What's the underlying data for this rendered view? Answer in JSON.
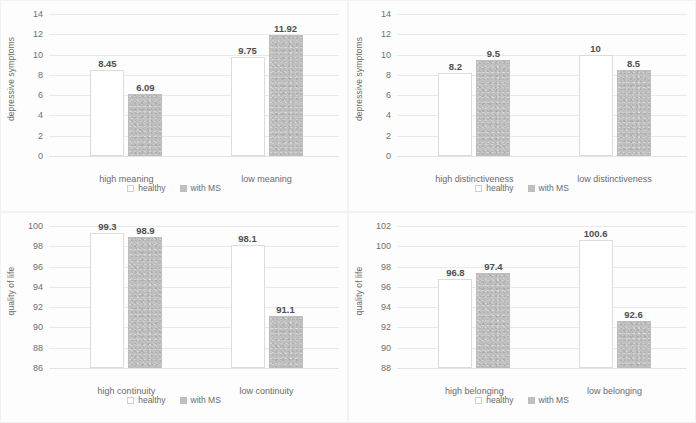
{
  "figure": {
    "panel_count": 4,
    "legend": {
      "healthy_label": "healthy",
      "ms_label": "with MS"
    },
    "colors": {
      "healthy_fill": "#ffffff",
      "healthy_border": "#dcdcdc",
      "ms_fill": "#c0c0c0",
      "ms_border": "#bdbdbd",
      "gridline": "#e9e9e9",
      "text": "#6b6b6b",
      "background": "#fdfdfd"
    }
  },
  "chart_data": [
    {
      "type": "bar",
      "panel": "top-left",
      "title": "",
      "xlabel": "",
      "ylabel": "depressive symptoms",
      "categories": [
        "high meaning",
        "low meaning"
      ],
      "series": [
        {
          "name": "healthy",
          "values": [
            8.45,
            9.75
          ]
        },
        {
          "name": "with MS",
          "values": [
            6.09,
            11.92
          ]
        }
      ],
      "data_labels": [
        "8.45",
        "6.09",
        "9.75",
        "11.92"
      ],
      "ylim": [
        0,
        14
      ],
      "yticks": [
        0,
        2,
        4,
        6,
        8,
        10,
        12,
        14
      ],
      "ytick_labels": [
        "0",
        "2",
        "4",
        "6",
        "8",
        "10",
        "12",
        "14"
      ],
      "grid": true,
      "legend_position": "bottom"
    },
    {
      "type": "bar",
      "panel": "top-right",
      "title": "",
      "xlabel": "",
      "ylabel": "depressive symptoms",
      "categories": [
        "high distinctiveness",
        "low distinctiveness"
      ],
      "series": [
        {
          "name": "healthy",
          "values": [
            8.2,
            10
          ]
        },
        {
          "name": "with MS",
          "values": [
            9.5,
            8.5
          ]
        }
      ],
      "data_labels": [
        "8.2",
        "9.5",
        "10",
        "8.5"
      ],
      "ylim": [
        0,
        14
      ],
      "yticks": [
        0,
        2,
        4,
        6,
        8,
        10,
        12,
        14
      ],
      "ytick_labels": [
        "0",
        "2",
        "4",
        "6",
        "8",
        "10",
        "12",
        "14"
      ],
      "grid": true,
      "legend_position": "bottom"
    },
    {
      "type": "bar",
      "panel": "bottom-left",
      "title": "",
      "xlabel": "",
      "ylabel": "quality of life",
      "categories": [
        "high continuity",
        "low continuity"
      ],
      "series": [
        {
          "name": "healthy",
          "values": [
            99.3,
            98.1
          ]
        },
        {
          "name": "with MS",
          "values": [
            98.9,
            91.1
          ]
        }
      ],
      "data_labels": [
        "99.3",
        "98.9",
        "98.1",
        "91.1"
      ],
      "ylim": [
        86,
        100
      ],
      "yticks": [
        86,
        88,
        90,
        92,
        94,
        96,
        98,
        100
      ],
      "ytick_labels": [
        "86",
        "88",
        "90",
        "92",
        "94",
        "96",
        "98",
        "100"
      ],
      "grid": true,
      "legend_position": "bottom"
    },
    {
      "type": "bar",
      "panel": "bottom-right",
      "title": "",
      "xlabel": "",
      "ylabel": "quality of life",
      "categories": [
        "high belonging",
        "low belonging"
      ],
      "series": [
        {
          "name": "healthy",
          "values": [
            96.8,
            100.6
          ]
        },
        {
          "name": "with MS",
          "values": [
            97.4,
            92.6
          ]
        }
      ],
      "data_labels": [
        "96.8",
        "97.4",
        "100.6",
        "92.6"
      ],
      "ylim": [
        88,
        102
      ],
      "yticks": [
        88,
        90,
        92,
        94,
        96,
        98,
        100,
        102
      ],
      "ytick_labels": [
        "88",
        "90",
        "92",
        "94",
        "96",
        "98",
        "100",
        "102"
      ],
      "grid": true,
      "legend_position": "bottom"
    }
  ]
}
